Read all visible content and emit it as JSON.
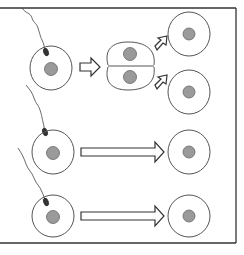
{
  "diagram": {
    "type": "biology-illustration",
    "colors": {
      "line": "#555555",
      "frame": "#333333",
      "nucleus": "#9a9a9a",
      "sperm_head": "#333333"
    },
    "rows": [
      {
        "name": "row-1",
        "input": "egg with sperm attached",
        "arrow": "short",
        "intermediate": "two-cell embryo",
        "outputs": [
          "cell",
          "cell"
        ]
      },
      {
        "name": "row-2",
        "input": "egg with sperm attached",
        "arrow": "long",
        "outputs": [
          "cell"
        ]
      },
      {
        "name": "row-3",
        "input": "egg with sperm attached",
        "arrow": "long",
        "outputs": [
          "cell"
        ]
      }
    ]
  }
}
